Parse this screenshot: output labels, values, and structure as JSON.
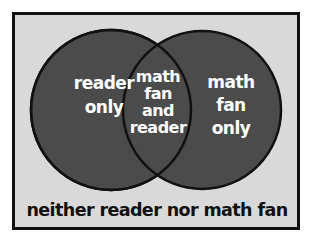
{
  "diagram": {
    "type": "venn",
    "colors": {
      "frame_border": "#111111",
      "frame_fill": "#d9d9d9",
      "circle_fill": "#4b4b4b",
      "circle_stroke": "#111111",
      "label_text": "#ffffff",
      "caption_text": "#111111"
    },
    "sets": [
      {
        "name": "reader"
      },
      {
        "name": "math fan"
      }
    ],
    "regions": {
      "left_only": {
        "line1": "reader",
        "line2": "only"
      },
      "intersection": {
        "line1": "math",
        "line2": "fan",
        "line3": "and",
        "line4": "reader"
      },
      "right_only": {
        "line1": "math",
        "line2": "fan",
        "line3": "only"
      }
    },
    "outside_label": "neither reader nor math fan"
  }
}
